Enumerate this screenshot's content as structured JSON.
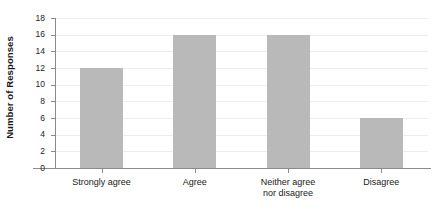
{
  "chart_data": {
    "type": "bar",
    "title": "",
    "subtitle": "",
    "xlabel": "",
    "ylabel": "Number of Responses",
    "categories": [
      "Strongly agree",
      "Agree",
      "Neither agree\nnor disagree",
      "Disagree"
    ],
    "category_labels_flat": [
      "Strongly agree",
      "Agree",
      "Neither agree nor disagree",
      "Disagree"
    ],
    "values": [
      12,
      16,
      16,
      6
    ],
    "ylim": [
      0,
      18
    ],
    "ytick_step": 2,
    "yticks": [
      0,
      2,
      4,
      6,
      8,
      10,
      12,
      14,
      16,
      18
    ],
    "ytick_labels": [
      "0",
      "2",
      "4",
      "6",
      "8",
      "10",
      "12",
      "14",
      "16",
      "18"
    ],
    "grid": true,
    "grid_axis": "y",
    "legend": false,
    "legend_position": "none",
    "bar_color": "#b9b9b9",
    "grid_color": "#ededed",
    "axis_color": "#8a8a8a",
    "text_color": "#1a1a1a",
    "background": "#ffffff"
  }
}
